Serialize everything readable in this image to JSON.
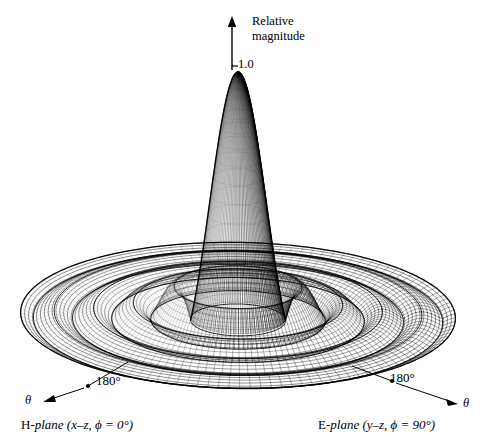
{
  "figure": {
    "kind": "3d-radiation-pattern",
    "background": "#ffffff",
    "ink": "#000000"
  },
  "axis": {
    "vertical_label_line1": "Relative",
    "vertical_label_line2": "magnitude",
    "peak_tick_label": "1.0",
    "arrow_name": "relative-magnitude-axis"
  },
  "annotations": {
    "left_angle": "180°",
    "right_angle": "180°",
    "left_theta": "θ",
    "right_theta": "θ",
    "h_plane_prefix": "H",
    "h_plane_text": "-plane (x–z, ϕ = 0°)",
    "e_plane_prefix": "E",
    "e_plane_text": "-plane (y–z, ϕ = 90°)"
  },
  "chart_data": {
    "type": "surface",
    "title": "",
    "subtitle": "",
    "xlabel": "θ (H-plane, x–z, ϕ = 0°)",
    "ylabel": "θ (E-plane, y–z, ϕ = 90°)",
    "zlabel": "Relative magnitude",
    "zlim": [
      0,
      1.0
    ],
    "z_ticks": [
      1.0
    ],
    "z_tick_labels": [
      "1.0"
    ],
    "radial_domain_deg": [
      -180,
      180
    ],
    "radial_tick_labels": [
      "180°",
      "180°"
    ],
    "grid": false,
    "legend": false,
    "pattern_function": "airy",
    "pattern_expression": "|2*J1(u)/u|, u = k*a*sin(theta)",
    "aperture_ka": 17.5,
    "main_lobe_peak": 1.0,
    "main_lobe_half_power_beamwidth_deg": 8,
    "sidelobe_peaks_relative": [
      1.0,
      0.132,
      0.065,
      0.04,
      0.028,
      0.021,
      0.016
    ],
    "sidelobe_peaks_db": [
      0,
      -17.6,
      -23.7,
      -28.0,
      -31.0,
      -33.5,
      -35.9
    ],
    "null_positions_u": [
      3.83,
      7.02,
      10.17,
      13.32,
      16.47,
      19.62
    ],
    "mesh": {
      "radial_lines": 68,
      "circumferential_lines": 120
    },
    "projection": {
      "type": "oblique-perspective",
      "center_px": [
        238,
        320
      ],
      "semi_major_px": 217,
      "semi_minor_px": 73,
      "z_scale_px": 248,
      "apex_px": [
        232,
        72
      ]
    },
    "samples_radial_profile": {
      "u": [
        0,
        1,
        2,
        3,
        3.83,
        5,
        5.14,
        6,
        7.02,
        8,
        8.42,
        9,
        10.17,
        11,
        11.62,
        13,
        13.32,
        14,
        14.8,
        16.47,
        18,
        19.62,
        21
      ],
      "magnitude": [
        1.0,
        0.88,
        0.577,
        0.226,
        0.0,
        0.103,
        0.132,
        0.115,
        0.0,
        0.054,
        0.065,
        0.059,
        0.0,
        0.035,
        0.04,
        0.021,
        0.0,
        0.022,
        0.028,
        0.0,
        0.019,
        0.0,
        0.015
      ]
    }
  }
}
